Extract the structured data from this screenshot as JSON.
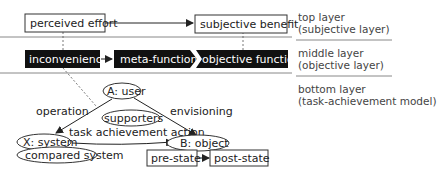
{
  "layers": {
    "top": {
      "line1": "top layer",
      "line2": "(subjective layer)"
    },
    "middle": {
      "line1": "middle layer",
      "line2": "(objective layer)"
    },
    "bottom": {
      "line1": "bottom layer",
      "line2": "(task-achievement model)"
    }
  },
  "top_nodes": {
    "perceived_effort": "perceived effort",
    "subjective_benefit": "subjective benefit"
  },
  "middle_nodes": {
    "inconvenience": "inconvenience",
    "meta_function": "meta-function",
    "objective_function": "objective function"
  },
  "bottom_nodes": {
    "user": "A: user",
    "supporters": "supporters",
    "system": "X: system",
    "compared_system": "compared system",
    "object": "B: object",
    "pre_state": "pre-state",
    "post_state": "post-state"
  },
  "edge_labels": {
    "operation": "operation",
    "envisioning": "envisioning",
    "task_achievement_action": "task achievement action"
  },
  "colors": {
    "dark_box": "#111111",
    "line": "#222222",
    "divider": "#888888"
  }
}
